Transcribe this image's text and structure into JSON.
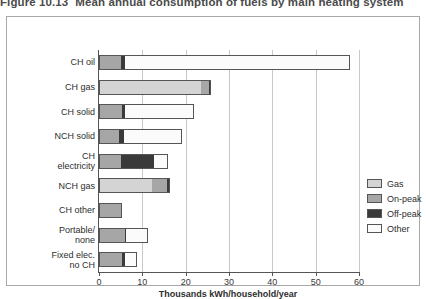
{
  "figure": {
    "caption_number": "Figure 10.13",
    "caption_text": "Mean annual consumption of fuels by main heating system"
  },
  "chart_data": {
    "type": "bar",
    "orientation": "horizontal",
    "stacked": true,
    "title": "Mean annual consumption of fuels by main heating system",
    "xlabel": "Thousands kWh/household/year",
    "ylabel": "",
    "xlim": [
      0,
      60
    ],
    "xticks": [
      0,
      10,
      20,
      30,
      40,
      50,
      60
    ],
    "xtick_labels": [
      "0",
      "10",
      "20",
      "30",
      "40",
      "50",
      "60"
    ],
    "grid": true,
    "grid_axis": "x",
    "legend_position": "right",
    "categories": [
      "CH oil",
      "CH gas",
      "CH solid",
      "NCH solid",
      "CH\nelectricity",
      "NCH gas",
      "CH other",
      "Portable/\nnone",
      "Fixed elec.\nno CH"
    ],
    "series": [
      {
        "name": "Gas",
        "color": "#d4d4d4",
        "values": [
          0.0,
          23.5,
          0.0,
          0.0,
          0.0,
          12.2,
          0.0,
          0.0,
          0.0
        ]
      },
      {
        "name": "On-peak",
        "color": "#a6a6a6",
        "values": [
          5.0,
          1.9,
          5.2,
          4.7,
          5.1,
          3.6,
          5.0,
          6.0,
          5.2
        ]
      },
      {
        "name": "Off-peak",
        "color": "#3a3a3a",
        "values": [
          0.9,
          0.4,
          0.9,
          1.0,
          7.7,
          0.5,
          0.4,
          0.3,
          0.8
        ]
      },
      {
        "name": "Other",
        "color": "#fbfbfb",
        "values": [
          52.1,
          0.0,
          15.8,
          13.5,
          3.1,
          0.0,
          0.0,
          5.0,
          2.7
        ]
      }
    ],
    "totals": [
      58.0,
      25.8,
      21.9,
      19.2,
      15.9,
      16.3,
      5.4,
      11.3,
      8.7
    ]
  },
  "legend": {
    "items": [
      {
        "label": "Gas",
        "color": "#d4d4d4"
      },
      {
        "label": "On-peak",
        "color": "#a6a6a6"
      },
      {
        "label": "Off-peak",
        "color": "#3a3a3a"
      },
      {
        "label": "Other",
        "color": "#fbfbfb"
      }
    ]
  }
}
